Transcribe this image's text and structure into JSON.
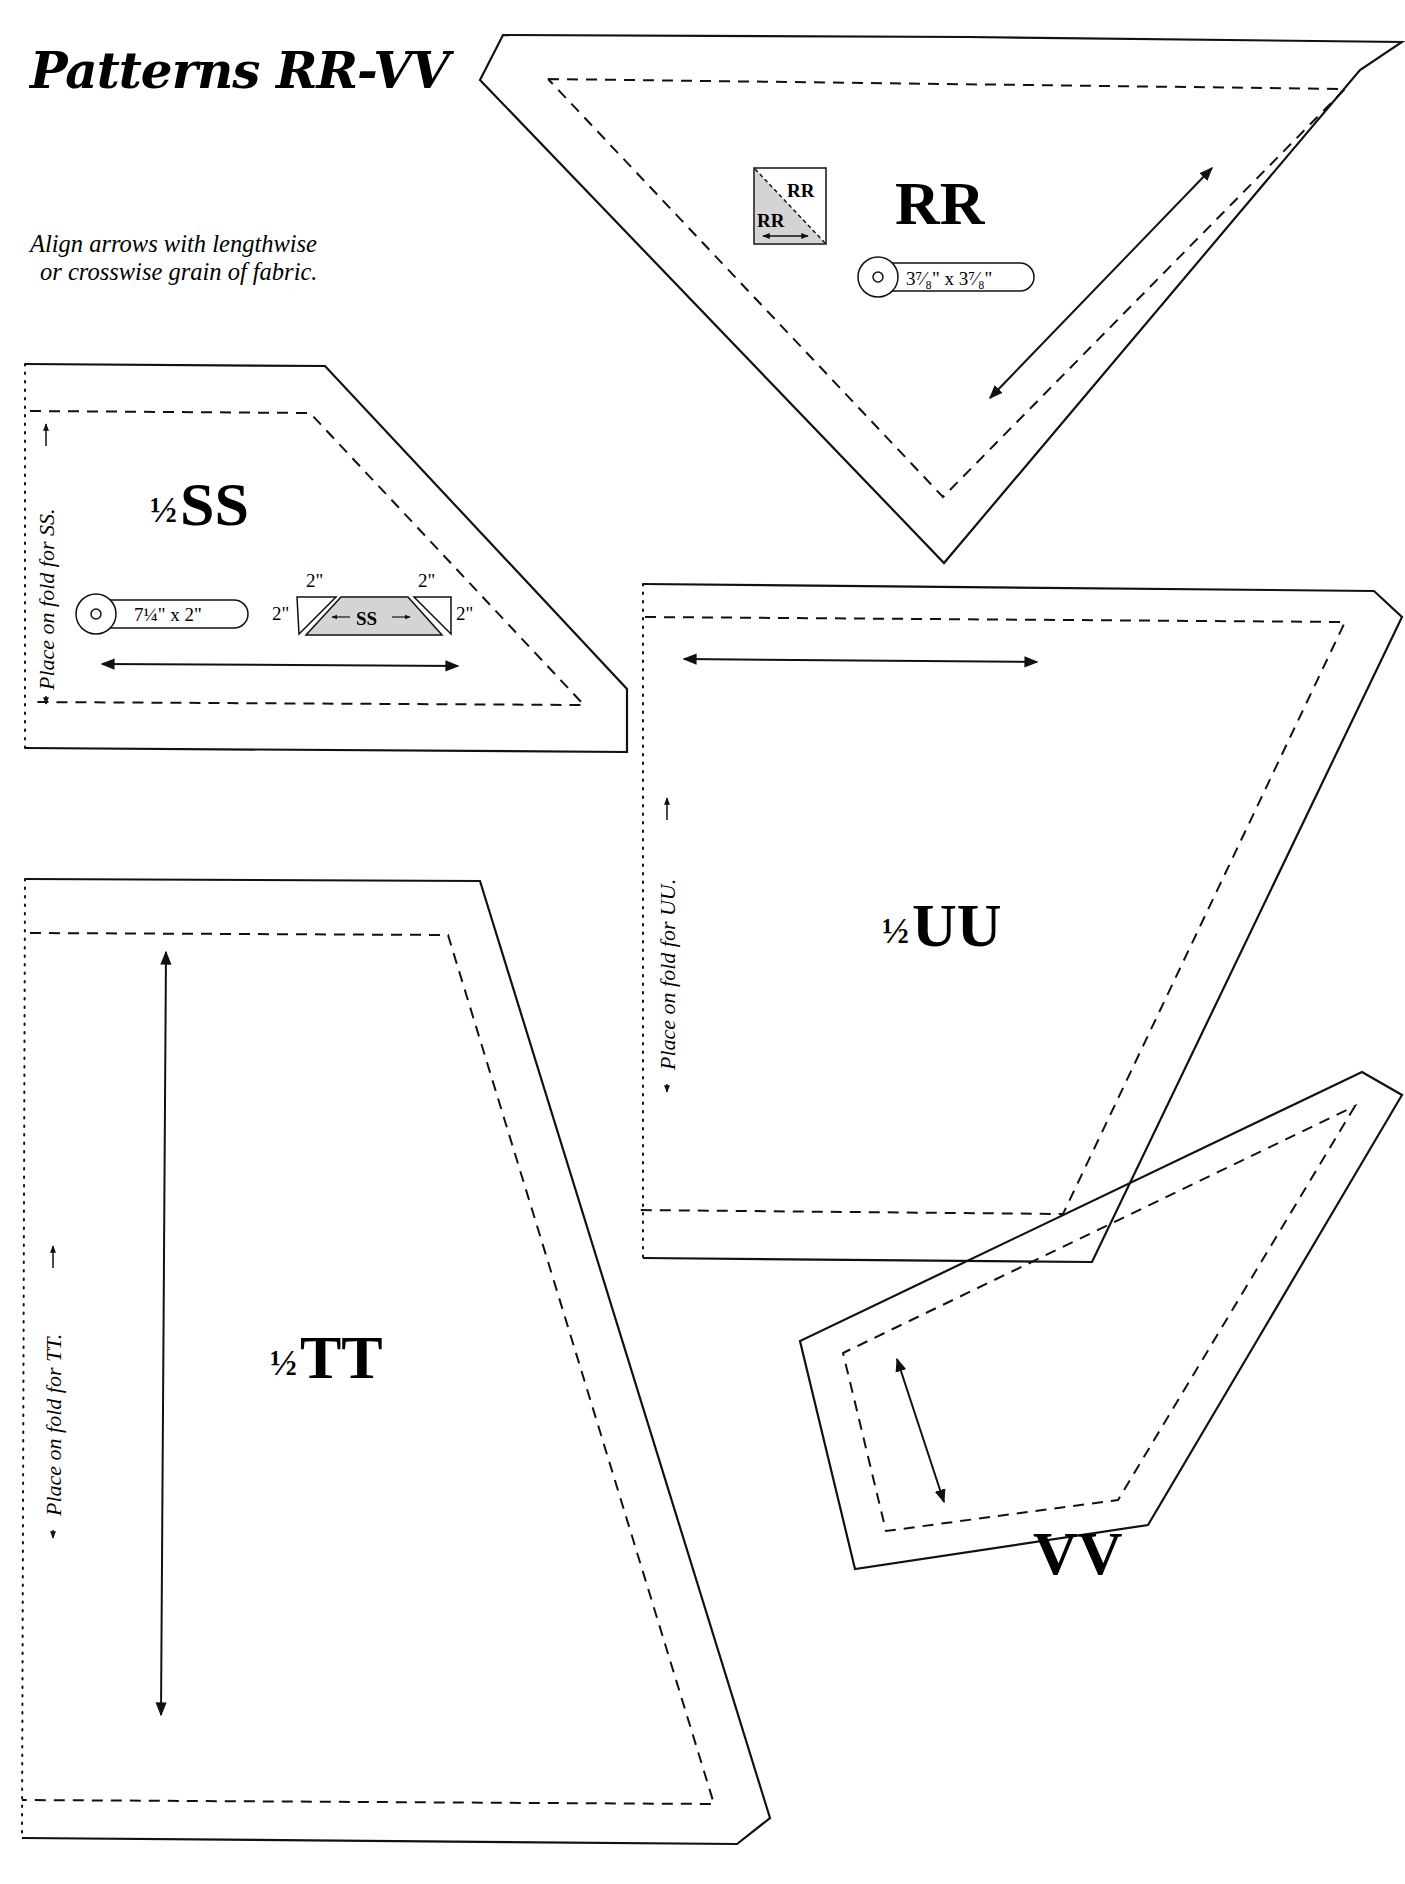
{
  "page": {
    "title": "Patterns RR-VV",
    "instruction_line1": "Align arrows with lengthwise",
    "instruction_line2": "or crosswise grain of fabric."
  },
  "patterns": {
    "rr": {
      "label": "RR",
      "diagram_label_top": "RR",
      "diagram_label_bottom": "RR",
      "cut_size": "3⁷⁄₈\" x 3⁷⁄₈\""
    },
    "ss": {
      "label_fraction": "½",
      "label": "SS",
      "fold_note": "Place on fold for SS.",
      "cut_size": "7¼\" x 2\"",
      "diagram_label": "SS",
      "diagram_dims": [
        "2\"",
        "2\"",
        "2\"",
        "2\""
      ]
    },
    "tt": {
      "label_fraction": "½",
      "label": "TT",
      "fold_note": "Place on fold for TT."
    },
    "uu": {
      "label_fraction": "½",
      "label": "UU",
      "fold_note": "Place on fold for UU."
    },
    "vv": {
      "label": "VV"
    }
  },
  "colors": {
    "line": "#111111",
    "diagram_fill": "#d4d4d4",
    "background": "#ffffff"
  }
}
